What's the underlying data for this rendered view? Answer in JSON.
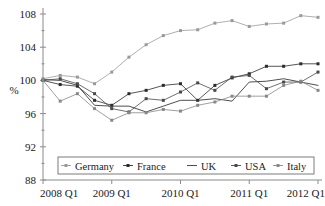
{
  "chart_data": {
    "type": "line",
    "title": "",
    "subtitle": "",
    "xlabel": "",
    "ylabel": "%",
    "ylim": [
      88,
      108
    ],
    "yticks": [
      88,
      92,
      96,
      100,
      104,
      108
    ],
    "ytick_labels": [
      "88",
      "92",
      "96",
      "100",
      "104",
      "108"
    ],
    "xlim": [
      0,
      16
    ],
    "xticks": [
      0,
      4,
      8,
      12,
      16
    ],
    "xtick_labels": [
      "2008 Q1",
      "2009 Q1",
      "2010 Q1",
      "2011 Q1",
      "2012 Q1"
    ],
    "x": [
      "2008 Q1",
      "2008 Q2",
      "2008 Q3",
      "2008 Q4",
      "2009 Q1",
      "2009 Q2",
      "2009 Q3",
      "2009 Q4",
      "2010 Q1",
      "2010 Q2",
      "2010 Q3",
      "2010 Q4",
      "2011 Q1",
      "2011 Q2",
      "2011 Q3",
      "2011 Q4",
      "2012 Q1"
    ],
    "grid": false,
    "legend_position": "inside-bottom",
    "series": [
      {
        "name": "Germany",
        "color": "#9a9a9a",
        "marker": "square",
        "values": [
          100.2,
          100.6,
          100.4,
          99.6,
          101.0,
          102.8,
          104.3,
          105.4,
          106.0,
          106.1,
          106.9,
          107.2,
          106.5,
          106.8,
          106.9,
          107.8,
          107.6
        ]
      },
      {
        "name": "France",
        "color": "#2b2b2b",
        "marker": "square",
        "values": [
          100.0,
          99.5,
          99.3,
          97.6,
          97.0,
          98.4,
          98.8,
          99.4,
          99.6,
          97.6,
          99.4,
          100.3,
          100.8,
          101.7,
          101.7,
          102.0,
          102.0
        ]
      },
      {
        "name": "UK",
        "color": "#3a3a3a",
        "marker": "none",
        "values": [
          100.1,
          100.0,
          99.4,
          97.0,
          96.9,
          96.9,
          96.2,
          96.9,
          97.6,
          97.6,
          97.8,
          97.5,
          99.8,
          99.9,
          100.2,
          99.8,
          99.4
        ]
      },
      {
        "name": "USA",
        "color": "#4a4a4a",
        "marker": "square",
        "values": [
          100.0,
          100.2,
          99.6,
          98.4,
          96.6,
          96.2,
          97.8,
          97.6,
          98.6,
          99.7,
          98.8,
          100.4,
          100.6,
          99.0,
          99.8,
          99.8,
          101.0
        ]
      },
      {
        "name": "Italy",
        "color": "#888888",
        "marker": "square",
        "values": [
          100.0,
          97.5,
          98.4,
          96.6,
          95.2,
          96.1,
          96.1,
          96.5,
          96.3,
          97.0,
          97.4,
          98.1,
          98.1,
          98.1,
          99.4,
          99.9,
          98.8
        ]
      }
    ]
  },
  "legend": {
    "items": [
      {
        "label": "Germany"
      },
      {
        "label": "France"
      },
      {
        "label": "UK"
      },
      {
        "label": "USA"
      },
      {
        "label": "Italy"
      }
    ]
  }
}
